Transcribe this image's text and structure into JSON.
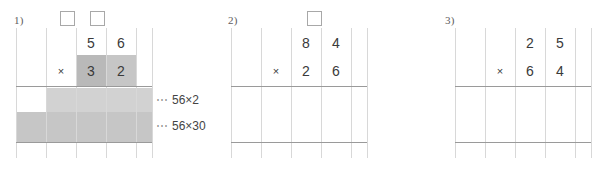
{
  "worksheet": {
    "title": "Long multiplication grid worksheet",
    "colors": {
      "grid_line": "#d8d8d8",
      "rule_line": "#9a9a9a",
      "shade_dark": "#b9b9b9",
      "shade_mid": "#c6c6c6",
      "shade_light": "#d2d2d2",
      "digit": "#3a3a3a",
      "label": "#5d5d5d",
      "annotation": "#444444"
    },
    "problems": [
      {
        "id": "problem-1",
        "label": "1)",
        "multiplicand": [
          "5",
          "6"
        ],
        "multiplier": [
          "3",
          "2"
        ],
        "operator": "×",
        "answer_boxes": 2,
        "partial_products": [
          {
            "id": "partial-1",
            "dots": "⋯",
            "text": "56×2"
          },
          {
            "id": "partial-2",
            "dots": "⋯",
            "text": "56×30"
          }
        ]
      },
      {
        "id": "problem-2",
        "label": "2)",
        "multiplicand": [
          "8",
          "4"
        ],
        "multiplier": [
          "2",
          "6"
        ],
        "operator": "×",
        "answer_boxes": 1,
        "partial_products": []
      },
      {
        "id": "problem-3",
        "label": "3)",
        "multiplicand": [
          "2",
          "5"
        ],
        "multiplier": [
          "6",
          "4"
        ],
        "operator": "×",
        "answer_boxes": 0,
        "partial_products": []
      }
    ]
  }
}
